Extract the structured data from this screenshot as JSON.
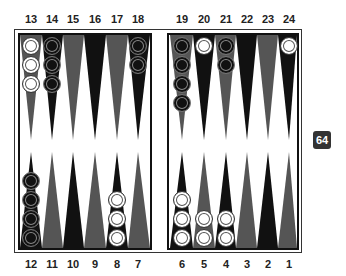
{
  "board": {
    "top_labels": [
      "13",
      "14",
      "15",
      "16",
      "17",
      "18",
      "19",
      "20",
      "21",
      "22",
      "23",
      "24"
    ],
    "bottom_labels": [
      "12",
      "11",
      "10",
      "9",
      "8",
      "7",
      "6",
      "5",
      "4",
      "3",
      "2",
      "1"
    ],
    "colors": {
      "dark_point": "#111111",
      "light_point": "#555555",
      "white_checker": "#ffffff",
      "black_checker": "#111111",
      "frame": "#111111"
    },
    "points": [
      {
        "point": 13,
        "checkers": 3,
        "color": "white"
      },
      {
        "point": 14,
        "checkers": 3,
        "color": "black"
      },
      {
        "point": 15,
        "checkers": 0,
        "color": null
      },
      {
        "point": 16,
        "checkers": 0,
        "color": null
      },
      {
        "point": 17,
        "checkers": 0,
        "color": null
      },
      {
        "point": 18,
        "checkers": 2,
        "color": "black"
      },
      {
        "point": 19,
        "checkers": 4,
        "color": "black"
      },
      {
        "point": 20,
        "checkers": 1,
        "color": "white"
      },
      {
        "point": 21,
        "checkers": 2,
        "color": "black"
      },
      {
        "point": 22,
        "checkers": 0,
        "color": null
      },
      {
        "point": 23,
        "checkers": 0,
        "color": null
      },
      {
        "point": 24,
        "checkers": 1,
        "color": "white"
      },
      {
        "point": 12,
        "checkers": 4,
        "color": "black"
      },
      {
        "point": 11,
        "checkers": 0,
        "color": null
      },
      {
        "point": 10,
        "checkers": 0,
        "color": null
      },
      {
        "point": 9,
        "checkers": 0,
        "color": null
      },
      {
        "point": 8,
        "checkers": 3,
        "color": "white"
      },
      {
        "point": 7,
        "checkers": 0,
        "color": null
      },
      {
        "point": 6,
        "checkers": 3,
        "color": "white"
      },
      {
        "point": 5,
        "checkers": 2,
        "color": "white"
      },
      {
        "point": 4,
        "checkers": 2,
        "color": "white"
      },
      {
        "point": 3,
        "checkers": 0,
        "color": null
      },
      {
        "point": 2,
        "checkers": 0,
        "color": null
      },
      {
        "point": 1,
        "checkers": 0,
        "color": null
      }
    ]
  },
  "doubling_cube": {
    "value": "64"
  }
}
